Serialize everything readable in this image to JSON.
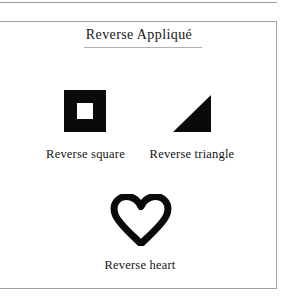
{
  "figure": {
    "title": "Reverse Appliqué",
    "background_color": "#ffffff",
    "ink_color": "#0a0a0a",
    "frame_color": "#a2a2a2",
    "items": [
      {
        "shape": "square-with-square-hole",
        "caption": "Reverse square"
      },
      {
        "shape": "right-triangle-solid",
        "caption": "Reverse triangle"
      },
      {
        "shape": "heart-outline",
        "caption": "Reverse heart"
      }
    ]
  }
}
